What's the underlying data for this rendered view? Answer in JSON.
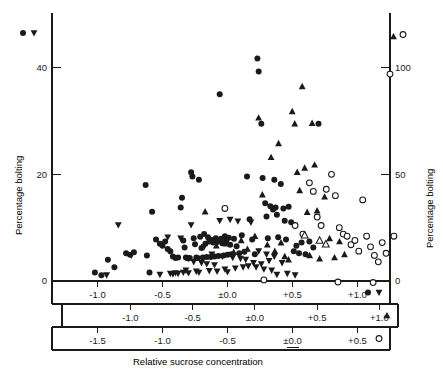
{
  "figure": {
    "type": "scatter",
    "x_axis_title": "Relative sucrose concentration",
    "y_axis_title_left": "Percentage bolting",
    "y_axis_title_right": "Percentage bolting",
    "background": "#ffffff",
    "ink": "#1a1a1a"
  },
  "axes": {
    "left": {
      "label": "Percentage bolting",
      "ticks": [
        0,
        20,
        40
      ],
      "tick_labels": [
        "0",
        "20",
        "40"
      ],
      "range": [
        0,
        48
      ],
      "side": "left"
    },
    "right": {
      "label": "Percentage bolting",
      "ticks": [
        0,
        50,
        100
      ],
      "tick_labels": [
        "0",
        "50",
        "100"
      ],
      "range": [
        0,
        120
      ],
      "side": "right"
    },
    "x_bands": [
      {
        "id": "band-1",
        "series": "filled-circle-and-down-triangle",
        "tick_labels": [
          "-1.0",
          "-0.5",
          "±0.0",
          "+0.5",
          "+1.0"
        ],
        "tick_values": [
          -1.0,
          -0.5,
          0.0,
          0.5,
          1.0
        ],
        "legend_markers": [
          "filled-circle",
          "down-triangle"
        ],
        "range": [
          -1.35,
          1.25
        ]
      },
      {
        "id": "band-2",
        "series": "up-triangle",
        "tick_labels": [
          "-1.0",
          "-0.5",
          "±0.0",
          "+0.5",
          "+1.0"
        ],
        "tick_values": [
          -1.0,
          -0.5,
          0.0,
          0.5,
          1.0
        ],
        "legend_markers": [
          "up-triangle"
        ],
        "range": [
          -1.55,
          1.15
        ]
      },
      {
        "id": "band-3",
        "series": "open-circle",
        "tick_labels": [
          "-1.5",
          "-1.0",
          "-0.5",
          "±0.0",
          "+0.5"
        ],
        "tick_values": [
          -1.5,
          -1.0,
          -0.5,
          0.0,
          0.5
        ],
        "legend_markers": [
          "open-circle"
        ],
        "range": [
          -1.85,
          0.75
        ]
      }
    ],
    "corner_legends": {
      "top_left": [
        "filled-circle",
        "down-triangle"
      ],
      "top_right": [
        "up-triangle",
        "open-circle"
      ]
    }
  },
  "chart_data": {
    "type": "scatter",
    "title": "",
    "xlabel": "Relative sucrose concentration",
    "ylabel": "Percentage bolting",
    "grid": false,
    "legend_position": "axis-ends",
    "xlim": [
      -1.35,
      1.25
    ],
    "ylim": [
      0,
      48
    ],
    "series": [
      {
        "name": "filled-circle",
        "marker": "filled-circle",
        "x_axis": "band-1",
        "y_axis": "left",
        "points": [
          [
            -1.02,
            1.6
          ],
          [
            -0.97,
            1.1
          ],
          [
            -0.92,
            4.0
          ],
          [
            -0.87,
            2.6
          ],
          [
            -0.78,
            5.2
          ],
          [
            -0.75,
            4.9
          ],
          [
            -0.72,
            5.4
          ],
          [
            -0.63,
            18.0
          ],
          [
            -0.62,
            4.8
          ],
          [
            -0.6,
            1.6
          ],
          [
            -0.58,
            13.0
          ],
          [
            -0.55,
            7.8
          ],
          [
            -0.52,
            7.0
          ],
          [
            -0.5,
            6.6
          ],
          [
            -0.48,
            7.4
          ],
          [
            -0.46,
            6.0
          ],
          [
            -0.44,
            5.6
          ],
          [
            -0.42,
            4.6
          ],
          [
            -0.4,
            4.3
          ],
          [
            -0.38,
            4.4
          ],
          [
            -0.36,
            13.8
          ],
          [
            -0.35,
            15.6
          ],
          [
            -0.34,
            7.6
          ],
          [
            -0.33,
            6.3
          ],
          [
            -0.32,
            4.4
          ],
          [
            -0.31,
            4.3
          ],
          [
            -0.3,
            4.2
          ],
          [
            -0.29,
            4.3
          ],
          [
            -0.28,
            20.4
          ],
          [
            -0.27,
            19.6
          ],
          [
            -0.26,
            8.0
          ],
          [
            -0.25,
            6.9
          ],
          [
            -0.24,
            4.4
          ],
          [
            -0.23,
            4.3
          ],
          [
            -0.22,
            19.0
          ],
          [
            -0.21,
            8.3
          ],
          [
            -0.2,
            6.2
          ],
          [
            -0.19,
            4.4
          ],
          [
            -0.18,
            8.8
          ],
          [
            -0.17,
            7.0
          ],
          [
            -0.16,
            4.5
          ],
          [
            -0.15,
            8.2
          ],
          [
            -0.14,
            7.4
          ],
          [
            -0.13,
            4.5
          ],
          [
            -0.12,
            7.7
          ],
          [
            -0.11,
            7.2
          ],
          [
            -0.1,
            4.6
          ],
          [
            -0.09,
            8.0
          ],
          [
            -0.08,
            7.3
          ],
          [
            -0.07,
            4.7
          ],
          [
            -0.06,
            35.0
          ],
          [
            -0.05,
            7.9
          ],
          [
            -0.04,
            7.1
          ],
          [
            -0.03,
            4.8
          ],
          [
            -0.02,
            8.4
          ],
          [
            -0.01,
            7.5
          ],
          [
            0.0,
            4.9
          ],
          [
            0.01,
            8.1
          ],
          [
            0.02,
            6.8
          ],
          [
            0.03,
            5.0
          ],
          [
            0.05,
            7.9
          ],
          [
            0.07,
            6.5
          ],
          [
            0.09,
            5.2
          ],
          [
            0.11,
            8.6
          ],
          [
            0.13,
            5.5
          ],
          [
            0.15,
            19.6
          ],
          [
            0.17,
            11.6
          ],
          [
            0.19,
            7.8
          ],
          [
            0.21,
            5.0
          ],
          [
            0.23,
            41.7
          ],
          [
            0.24,
            39.3
          ],
          [
            0.26,
            29.5
          ],
          [
            0.27,
            19.3
          ],
          [
            0.29,
            14.6
          ],
          [
            0.3,
            12.1
          ],
          [
            0.31,
            8.0
          ],
          [
            0.33,
            14.0
          ],
          [
            0.35,
            13.4
          ],
          [
            0.36,
            19.0
          ],
          [
            0.37,
            13.8
          ],
          [
            0.38,
            12.4
          ],
          [
            0.39,
            8.2
          ],
          [
            0.41,
            18.2
          ],
          [
            0.43,
            13.6
          ],
          [
            0.44,
            11.3
          ],
          [
            0.45,
            7.8
          ],
          [
            0.47,
            13.9
          ],
          [
            0.49,
            11.0
          ],
          [
            0.51,
            5.6
          ],
          [
            0.53,
            6.6
          ],
          [
            0.55,
            5.2
          ],
          [
            0.57,
            7.2
          ],
          [
            0.6,
            5.0
          ],
          [
            0.63,
            7.4
          ],
          [
            0.66,
            6.3
          ],
          [
            0.7,
            29.5
          ]
        ]
      },
      {
        "name": "down-triangle",
        "marker": "down-triangle",
        "x_axis": "band-1",
        "y_axis": "left",
        "points": [
          [
            -0.93,
            1.1
          ],
          [
            -0.84,
            10.5
          ],
          [
            -0.74,
            4.8
          ],
          [
            -0.52,
            1.2
          ],
          [
            -0.46,
            8.2
          ],
          [
            -0.44,
            1.4
          ],
          [
            -0.42,
            1.3
          ],
          [
            -0.4,
            1.5
          ],
          [
            -0.38,
            1.4
          ],
          [
            -0.36,
            8.0
          ],
          [
            -0.34,
            1.6
          ],
          [
            -0.32,
            2.0
          ],
          [
            -0.3,
            1.5
          ],
          [
            -0.28,
            10.5
          ],
          [
            -0.26,
            3.6
          ],
          [
            -0.24,
            1.8
          ],
          [
            -0.22,
            1.6
          ],
          [
            -0.2,
            3.4
          ],
          [
            -0.18,
            6.4
          ],
          [
            -0.16,
            3.2
          ],
          [
            -0.14,
            1.9
          ],
          [
            -0.12,
            5.0
          ],
          [
            -0.1,
            3.0
          ],
          [
            -0.08,
            1.8
          ],
          [
            -0.06,
            11.3
          ],
          [
            -0.04,
            4.6
          ],
          [
            -0.02,
            2.2
          ],
          [
            0.0,
            1.7
          ],
          [
            0.02,
            11.5
          ],
          [
            0.04,
            4.4
          ],
          [
            0.06,
            2.4
          ],
          [
            0.08,
            11.2
          ],
          [
            0.1,
            4.2
          ],
          [
            0.12,
            2.6
          ],
          [
            0.14,
            4.0
          ],
          [
            0.16,
            2.8
          ],
          [
            0.18,
            11.0
          ],
          [
            0.2,
            3.4
          ],
          [
            0.22,
            2.6
          ],
          [
            0.24,
            5.6
          ],
          [
            0.26,
            3.2
          ],
          [
            0.28,
            2.2
          ],
          [
            0.3,
            5.0
          ],
          [
            0.32,
            3.8
          ],
          [
            0.34,
            2.0
          ],
          [
            0.36,
            4.6
          ],
          [
            0.38,
            1.2
          ],
          [
            0.42,
            3.4
          ],
          [
            0.46,
            1.4
          ],
          [
            0.52,
            1.1
          ]
        ]
      },
      {
        "name": "up-triangle",
        "marker": "up-triangle",
        "x_axis": "band-2",
        "y_axis": "left",
        "points": [
          [
            -0.4,
            13.0
          ],
          [
            -0.31,
            6.6
          ],
          [
            -0.23,
            7.0
          ],
          [
            -0.17,
            5.4
          ],
          [
            -0.11,
            7.6
          ],
          [
            -0.06,
            6.0
          ],
          [
            0.0,
            8.4
          ],
          [
            0.03,
            30.6
          ],
          [
            0.06,
            16.2
          ],
          [
            0.1,
            6.8
          ],
          [
            0.13,
            23.2
          ],
          [
            0.16,
            5.6
          ],
          [
            0.19,
            25.8
          ],
          [
            0.21,
            7.2
          ],
          [
            0.24,
            4.6
          ],
          [
            0.27,
            4.0
          ],
          [
            0.3,
            31.8
          ],
          [
            0.32,
            29.5
          ],
          [
            0.34,
            20.4
          ],
          [
            0.36,
            17.0
          ],
          [
            0.38,
            36.5
          ],
          [
            0.4,
            21.2
          ],
          [
            0.42,
            12.9
          ],
          [
            0.44,
            4.8
          ],
          [
            0.46,
            29.6
          ],
          [
            0.48,
            21.8
          ],
          [
            0.5,
            13.2
          ],
          [
            0.52,
            4.2
          ],
          [
            0.56,
            15.8
          ],
          [
            0.6,
            8.0
          ],
          [
            0.64,
            4.4
          ],
          [
            0.68,
            7.4
          ],
          [
            0.72,
            5.0
          ]
        ]
      },
      {
        "name": "open-circle",
        "marker": "open-circle",
        "x_axis": "band-3",
        "y_axis": "right",
        "points": [
          [
            -0.52,
            34.0
          ],
          [
            -0.22,
            0.5
          ],
          [
            0.02,
            26.0
          ],
          [
            0.08,
            22.0
          ],
          [
            0.13,
            46.0
          ],
          [
            0.16,
            42.0
          ],
          [
            0.19,
            30.0
          ],
          [
            0.22,
            26.0
          ],
          [
            0.26,
            43.0
          ],
          [
            0.3,
            50.0
          ],
          [
            0.33,
            40.0
          ],
          [
            0.36,
            25.0
          ],
          [
            0.39,
            22.0
          ],
          [
            0.42,
            21.0
          ],
          [
            0.45,
            17.0
          ],
          [
            0.48,
            19.0
          ],
          [
            0.51,
            14.0
          ],
          [
            0.54,
            38.0
          ],
          [
            0.57,
            21.0
          ],
          [
            0.6,
            16.0
          ],
          [
            0.63,
            12.0
          ],
          [
            0.66,
            9.0
          ],
          [
            0.69,
            18.0
          ],
          [
            0.72,
            13.0
          ],
          [
            0.75,
            97.0
          ],
          [
            0.78,
            21.0
          ],
          [
            0.81,
            5.0
          ],
          [
            0.84,
            1.0
          ],
          [
            0.87,
            48.0
          ],
          [
            0.9,
            25.0
          ],
          [
            0.93,
            20.0
          ],
          [
            0.96,
            7.0
          ],
          [
            0.99,
            6.0
          ],
          [
            1.02,
            22.0
          ],
          [
            1.05,
            4.0
          ],
          [
            1.08,
            21.0
          ],
          [
            1.11,
            9.0
          ]
        ]
      }
    ]
  }
}
